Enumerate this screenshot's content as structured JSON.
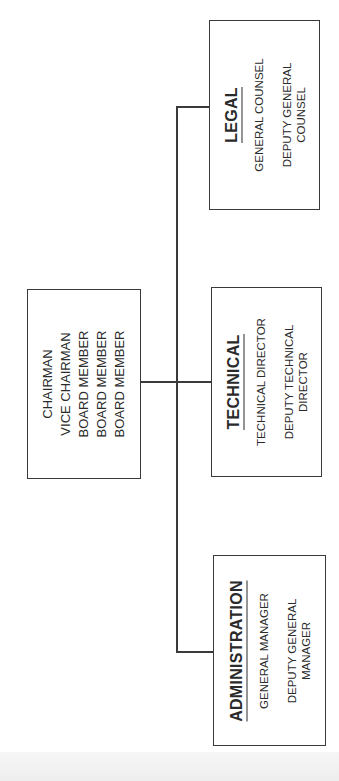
{
  "chart_title": "",
  "board": {
    "lines": [
      "CHAIRMAN",
      "VICE CHAIRMAN",
      "BOARD MEMBER",
      "BOARD MEMBER",
      "BOARD MEMBER"
    ]
  },
  "departments": [
    {
      "name": "LEGAL",
      "positions": [
        "GENERAL COUNSEL"
      ],
      "deputy": [
        "DEPUTY GENERAL",
        "COUNSEL"
      ]
    },
    {
      "name": "TECHNICAL",
      "positions": [
        "TECHNICAL DIRECTOR"
      ],
      "deputy": [
        "DEPUTY TECHNICAL",
        "DIRECTOR"
      ]
    },
    {
      "name": "ADMINISTRATION",
      "positions": [
        "GENERAL MANAGER"
      ],
      "deputy": [
        "DEPUTY GENERAL",
        "MANAGER"
      ]
    }
  ],
  "colors": {
    "line": "#3a3a3a",
    "text": "#2a2a2a",
    "background": "#ffffff"
  },
  "orientation": "rotated 90deg counter-clockwise"
}
